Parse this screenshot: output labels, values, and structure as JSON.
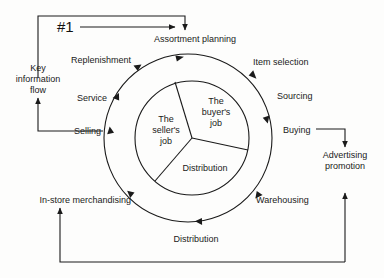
{
  "diagram": {
    "title_marker": "#1",
    "outer_cycle_labels": [
      {
        "id": "assortment-planning",
        "text": "Assortment planning",
        "x": 195,
        "y": 40,
        "align": "ctr"
      },
      {
        "id": "item-selection",
        "text": "Item selection",
        "x": 253,
        "y": 62,
        "align": "lft"
      },
      {
        "id": "sourcing",
        "text": "Sourcing",
        "x": 277,
        "y": 96,
        "align": "lft"
      },
      {
        "id": "buying",
        "text": "Buying",
        "x": 283,
        "y": 131,
        "align": "lft"
      },
      {
        "id": "warehousing",
        "text": "Warehousing",
        "x": 256,
        "y": 200,
        "align": "lft"
      },
      {
        "id": "distribution-outer",
        "text": "Distribution",
        "x": 196,
        "y": 239,
        "align": "ctr"
      },
      {
        "id": "in-store-merchandising",
        "text": "In-store merchandising",
        "x": 131,
        "y": 200,
        "align": "rgt"
      },
      {
        "id": "selling",
        "text": "Selling",
        "x": 101,
        "y": 131,
        "align": "rgt"
      },
      {
        "id": "service",
        "text": "Service",
        "x": 107,
        "y": 98,
        "align": "rgt"
      },
      {
        "id": "replenishment",
        "text": "Replenishment",
        "x": 131,
        "y": 60,
        "align": "rgt"
      }
    ],
    "side_nodes": [
      {
        "id": "key-information-flow",
        "lines": [
          "Key",
          "information",
          "flow"
        ],
        "x": 38,
        "y": 78
      },
      {
        "id": "advertising-promotion",
        "lines": [
          "Advertising",
          "promotion"
        ],
        "x": 345,
        "y": 160
      }
    ],
    "inner_segments": [
      {
        "id": "buyers-job",
        "lines": [
          "The",
          "buyer's",
          "job"
        ],
        "cx": 216,
        "cy": 112
      },
      {
        "id": "sellers-job",
        "lines": [
          "The",
          "seller's",
          "job"
        ],
        "cx": 166,
        "cy": 130
      },
      {
        "id": "distribution-inner",
        "lines": [
          "Distribution"
        ],
        "cx": 205,
        "cy": 168
      }
    ],
    "colors": {
      "stroke": "#1a1a1a",
      "text": "#1a1a1a",
      "background": "#fdfdfc"
    },
    "geometry": {
      "outer_circle": {
        "cx": 188,
        "cy": 138,
        "r": 84
      },
      "inner_circle": {
        "cx": 192,
        "cy": 138,
        "r": 57
      }
    }
  }
}
